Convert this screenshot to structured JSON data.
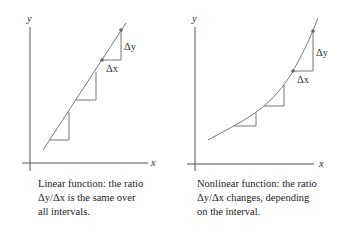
{
  "panels": [
    {
      "id": "linear",
      "axis_labels": {
        "x": "x",
        "y": "y"
      },
      "delta_y_label": "Δy",
      "delta_x_label": "Δx",
      "caption": [
        "Linear function: the ratio",
        "Δy/Δx is the same over",
        "all intervals."
      ]
    },
    {
      "id": "nonlinear",
      "axis_labels": {
        "x": "x",
        "y": "y"
      },
      "delta_y_label": "Δy",
      "delta_x_label": "Δx",
      "caption": [
        "Nonlinear function: the ratio",
        "Δy/Δx changes, depending",
        "on the interval."
      ]
    }
  ],
  "colors": {
    "axis": "#555555",
    "curve": "#777777",
    "point": "#666666",
    "text": "#222222"
  }
}
